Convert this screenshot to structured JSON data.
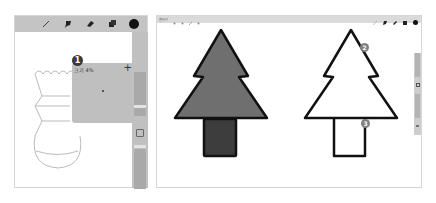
{
  "left_screen": {
    "toolbar": {
      "tools": [
        {
          "name": "pencil-icon"
        },
        {
          "name": "ink-brush-icon"
        },
        {
          "name": "eraser-icon"
        },
        {
          "name": "layers-icon"
        },
        {
          "name": "color-swatch",
          "color": "#111111"
        }
      ]
    },
    "popup": {
      "badge": "1",
      "label": "크기 4%",
      "plus": "+"
    },
    "sidebar": {
      "square_button": "modify-button"
    }
  },
  "right_screen": {
    "toolbar_left": {
      "gallery_label": "갤러리",
      "icons": [
        "wrench-icon",
        "magic-wand-icon",
        "selection-icon",
        "transform-icon"
      ]
    },
    "toolbar_right": {
      "tools": [
        "pencil-icon",
        "ink-brush-icon",
        "eraser-icon",
        "layers-icon",
        "color-swatch"
      ]
    },
    "annotations": [
      {
        "badge": "2"
      },
      {
        "badge": "3"
      }
    ],
    "colors": {
      "filled_tree": "#6f6f6f",
      "filled_trunk": "#3d3d3d",
      "outline": "#111111"
    }
  }
}
